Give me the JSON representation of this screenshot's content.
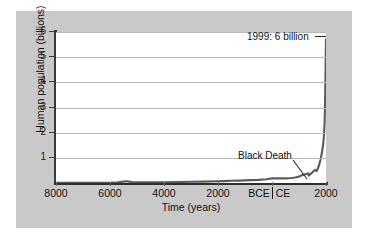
{
  "chart_data": {
    "type": "line",
    "title": "",
    "xlabel": "Time (years)",
    "ylabel": "Human population (billions)",
    "ylim": [
      0,
      6.3
    ],
    "yticks": [
      1,
      2,
      3,
      4,
      5,
      6
    ],
    "ytick_labels": [
      "1",
      "2",
      "3",
      "4",
      "5",
      "6"
    ],
    "xlim": [
      -8000,
      2000
    ],
    "xticks": [
      -8000,
      -6000,
      -4000,
      -2000,
      0,
      2000
    ],
    "xtick_labels": [
      "8000",
      "6000",
      "4000",
      "2000",
      "BCE|CE",
      "2000"
    ],
    "era_labels": {
      "before": "BCE",
      "after": "CE"
    },
    "grid": "horizontal",
    "legend": "none",
    "series": [
      {
        "name": "Human population",
        "x": [
          -8000,
          -7600,
          -7200,
          -6800,
          -6400,
          -6000,
          -5700,
          -5500,
          -5400,
          -5300,
          -5200,
          -5000,
          -4800,
          -4500,
          -4000,
          -3500,
          -3000,
          -2500,
          -2000,
          -1800,
          -1500,
          -1200,
          -1000,
          -800,
          -500,
          -200,
          0,
          200,
          400,
          500,
          600,
          700,
          800,
          900,
          1000,
          1100,
          1200,
          1300,
          1340,
          1350,
          1360,
          1400,
          1500,
          1600,
          1650,
          1700,
          1750,
          1800,
          1850,
          1900,
          1930,
          1950,
          1960,
          1970,
          1980,
          1990,
          1999
        ],
        "y": [
          0.005,
          0.006,
          0.007,
          0.008,
          0.009,
          0.01,
          0.03,
          0.06,
          0.075,
          0.06,
          0.04,
          0.03,
          0.03,
          0.032,
          0.035,
          0.04,
          0.05,
          0.06,
          0.07,
          0.08,
          0.09,
          0.1,
          0.11,
          0.12,
          0.13,
          0.16,
          0.19,
          0.2,
          0.19,
          0.19,
          0.2,
          0.21,
          0.22,
          0.24,
          0.265,
          0.32,
          0.36,
          0.39,
          0.4,
          0.33,
          0.31,
          0.35,
          0.45,
          0.55,
          0.5,
          0.6,
          0.79,
          0.98,
          1.26,
          1.65,
          2.07,
          2.52,
          3.02,
          3.7,
          4.44,
          5.27,
          6.0
        ]
      }
    ],
    "annotations": [
      {
        "text": "1999: 6 billion",
        "target_x": 1999,
        "target_y": 6.0
      },
      {
        "text": "Black Death",
        "target_x": 1350,
        "target_y": 0.33
      }
    ],
    "colors": {
      "figure_background": "#c9c9c9",
      "plot_background": "#ffffff",
      "line": "#5a5a5a",
      "gridline": "#b9b9b9",
      "axis": "#2e2e2e",
      "text": "#111111"
    }
  }
}
